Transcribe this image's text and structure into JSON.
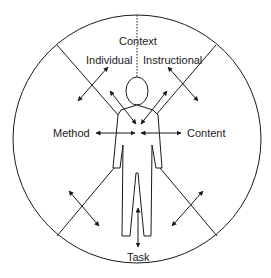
{
  "diagram": {
    "labels": {
      "context": "Context",
      "individual": "Individual",
      "instructional": "Instructional",
      "method": "Method",
      "content": "Content",
      "task": "Task"
    },
    "colors": {
      "stroke": "#1a1a1a",
      "background": "#ffffff"
    },
    "circle": {
      "cx": 137,
      "cy": 139,
      "r": 124
    }
  }
}
